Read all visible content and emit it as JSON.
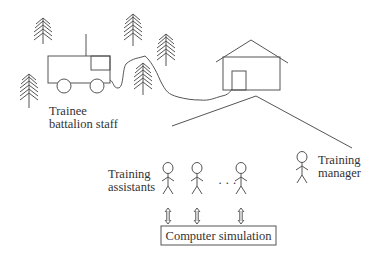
{
  "diagram": {
    "labels": {
      "trainee": [
        "Trainee",
        "battalion staff"
      ],
      "assistants": [
        "Training",
        "assistants"
      ],
      "manager": [
        "Training",
        "manager"
      ],
      "simulation": "Computer simulation",
      "ellipsis": "· · ·"
    },
    "elements": {
      "trees": 5,
      "vehicle": "field command vehicle with antenna",
      "building": "house with door",
      "assistant_figures": 3,
      "manager_figures": 1,
      "arrows": "bidirectional (assistant ↔ simulation)"
    },
    "colors": {
      "stroke": "#555555",
      "text": "#333333",
      "background": "#ffffff"
    }
  }
}
